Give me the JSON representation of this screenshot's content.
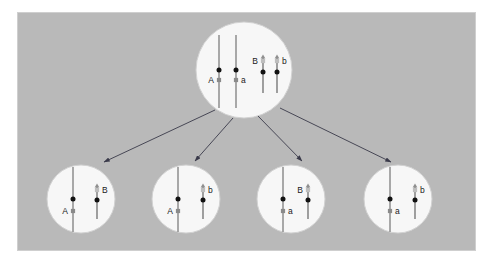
{
  "figure": {
    "canvas": {
      "width": 492,
      "height": 264
    },
    "colors": {
      "page_background": "#ffffff",
      "panel_background": "#b9b9b9",
      "panel_border": "#cfcfcf",
      "cell_fill": "#f7f7f7",
      "cell_stroke": "#d2d2d2",
      "long_chromosome_arm": "#9a9a9a",
      "short_chromosome_arm": "#8f8f8f",
      "centromere": "#111111",
      "allele_marker_dark": "#8a8a8a",
      "allele_marker_light": "#bdbdbd",
      "arrow": "#3a3a4a",
      "label_text": "#1a1a1a"
    },
    "panel": {
      "x": 17,
      "y": 12,
      "width": 458,
      "height": 238
    }
  },
  "parent_cell": {
    "name": "parent-cell",
    "center_x": 244,
    "center_y": 70,
    "radius": 48,
    "chromosomes": [
      {
        "id": "parent-long-A",
        "allele_label": "A",
        "type": "long",
        "x": 219,
        "top_y": 35,
        "bottom_y": 108,
        "centromere_y": 70,
        "marker_y": 80,
        "marker_tone": "dark",
        "label_side": "left",
        "has_arrowhead": false
      },
      {
        "id": "parent-long-a",
        "allele_label": "a",
        "type": "long",
        "x": 236,
        "top_y": 35,
        "bottom_y": 108,
        "centromere_y": 70,
        "marker_y": 80,
        "marker_tone": "dark",
        "label_side": "right",
        "has_arrowhead": false
      },
      {
        "id": "parent-short-B",
        "allele_label": "B",
        "type": "short",
        "x": 263,
        "top_y": 57,
        "bottom_y": 93,
        "centromere_y": 72,
        "marker_y": 61,
        "marker_tone": "light",
        "label_side": "left",
        "has_arrowhead": true
      },
      {
        "id": "parent-short-b",
        "allele_label": "b",
        "type": "short",
        "x": 277,
        "top_y": 57,
        "bottom_y": 93,
        "centromere_y": 72,
        "marker_y": 61,
        "marker_tone": "light",
        "label_side": "right",
        "has_arrowhead": true
      }
    ]
  },
  "daughter_cells": [
    {
      "id": "daughter-cell-1",
      "name": "daughter-cell-AB",
      "genotype": "AB",
      "center_x": 81,
      "center_y": 199,
      "radius": 34,
      "chromosomes": [
        {
          "id": "d1-long-A",
          "allele_label": "A",
          "type": "long",
          "x": 73,
          "top_y": 167,
          "bottom_y": 232,
          "centromere_y": 199,
          "marker_y": 211,
          "marker_tone": "dark",
          "label_side": "left",
          "has_arrowhead": false
        },
        {
          "id": "d1-short-B",
          "allele_label": "B",
          "type": "short",
          "x": 97,
          "top_y": 186,
          "bottom_y": 219,
          "centromere_y": 200,
          "marker_y": 190,
          "marker_tone": "light",
          "label_side": "right",
          "has_arrowhead": true
        }
      ]
    },
    {
      "id": "daughter-cell-2",
      "name": "daughter-cell-Ab",
      "genotype": "Ab",
      "center_x": 186,
      "center_y": 199,
      "radius": 34,
      "chromosomes": [
        {
          "id": "d2-long-A",
          "allele_label": "A",
          "type": "long",
          "x": 178,
          "top_y": 167,
          "bottom_y": 232,
          "centromere_y": 199,
          "marker_y": 211,
          "marker_tone": "dark",
          "label_side": "left",
          "has_arrowhead": false
        },
        {
          "id": "d2-short-b",
          "allele_label": "b",
          "type": "short",
          "x": 203,
          "top_y": 186,
          "bottom_y": 219,
          "centromere_y": 200,
          "marker_y": 190,
          "marker_tone": "light",
          "label_side": "right",
          "has_arrowhead": true
        }
      ]
    },
    {
      "id": "daughter-cell-3",
      "name": "daughter-cell-aB",
      "genotype": "aB",
      "center_x": 291,
      "center_y": 199,
      "radius": 34,
      "chromosomes": [
        {
          "id": "d3-long-a",
          "allele_label": "a",
          "type": "long",
          "x": 283,
          "top_y": 167,
          "bottom_y": 232,
          "centromere_y": 199,
          "marker_y": 211,
          "marker_tone": "dark",
          "label_side": "right",
          "has_arrowhead": false
        },
        {
          "id": "d3-short-B",
          "allele_label": "B",
          "type": "short",
          "x": 308,
          "top_y": 186,
          "bottom_y": 219,
          "centromere_y": 200,
          "marker_y": 190,
          "marker_tone": "light",
          "label_side": "left",
          "has_arrowhead": true
        }
      ]
    },
    {
      "id": "daughter-cell-4",
      "name": "daughter-cell-ab",
      "genotype": "ab",
      "center_x": 398,
      "center_y": 199,
      "radius": 34,
      "chromosomes": [
        {
          "id": "d4-long-a",
          "allele_label": "a",
          "type": "long",
          "x": 390,
          "top_y": 167,
          "bottom_y": 232,
          "centromere_y": 199,
          "marker_y": 211,
          "marker_tone": "dark",
          "label_side": "right",
          "has_arrowhead": false
        },
        {
          "id": "d4-short-b",
          "allele_label": "b",
          "type": "short",
          "x": 415,
          "top_y": 186,
          "bottom_y": 219,
          "centromere_y": 200,
          "marker_y": 190,
          "marker_tone": "light",
          "label_side": "right",
          "has_arrowhead": true
        }
      ]
    }
  ],
  "arrows": [
    {
      "id": "arrow-to-daughter-1",
      "x1": 215,
      "y1": 110,
      "x2": 104,
      "y2": 162
    },
    {
      "id": "arrow-to-daughter-2",
      "x1": 233,
      "y1": 118,
      "x2": 195,
      "y2": 161
    },
    {
      "id": "arrow-to-daughter-3",
      "x1": 258,
      "y1": 116,
      "x2": 302,
      "y2": 161
    },
    {
      "id": "arrow-to-daughter-4",
      "x1": 280,
      "y1": 108,
      "x2": 391,
      "y2": 162
    }
  ]
}
